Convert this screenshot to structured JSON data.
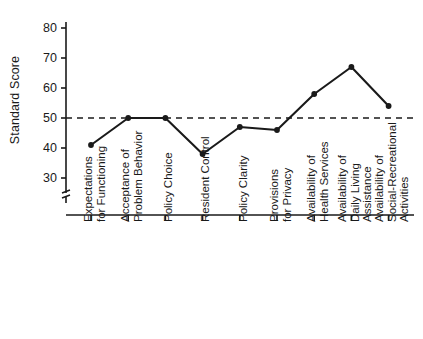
{
  "chart_data": {
    "type": "line",
    "title": "",
    "xlabel": "",
    "ylabel": "Standard Score",
    "ylim": [
      30,
      80
    ],
    "yticks": [
      30,
      40,
      50,
      60,
      70,
      80
    ],
    "ytick_labels": [
      "30",
      "40",
      "50",
      "60",
      "70",
      "80"
    ],
    "axis_break": true,
    "grid": false,
    "legend": "none",
    "reference_line": {
      "value": 50,
      "style": "dashed",
      "orientation": "horizontal"
    },
    "marker": "filled-circle",
    "line_color": "#1a1a1a",
    "categories": [
      "Expectations\nfor Functioning",
      "Acceptance of\nProblem Behavior",
      "Policy Choice",
      "Resident Control",
      "Policy Clarity",
      "Provisions\nfor Privacy",
      "Availability of\nHealth Services",
      "Availability of\nDaily Living\nAssistance",
      "Availability of\nSocial-Recreational\nActivities"
    ],
    "category_lines": [
      [
        "Expectations",
        "for Functioning"
      ],
      [
        "Acceptance of",
        "Problem Behavior"
      ],
      [
        "Policy Choice"
      ],
      [
        "Resident Control"
      ],
      [
        "Policy Clarity"
      ],
      [
        "Provisions",
        "for Privacy"
      ],
      [
        "Availability of",
        "Health Services"
      ],
      [
        "Availability of",
        "Daily Living",
        "Assistance"
      ],
      [
        "Availability of",
        "Social-Recreational",
        "Activities"
      ]
    ],
    "values": [
      41,
      50,
      50,
      38,
      47,
      46,
      58,
      67,
      54
    ]
  }
}
